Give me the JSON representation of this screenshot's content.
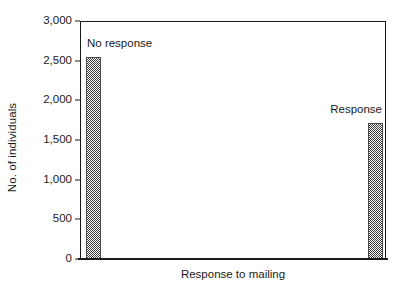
{
  "chart_data": {
    "type": "bar",
    "title": "",
    "xlabel": "Response to mailing",
    "ylabel": "No. of individuals",
    "categories": [
      "No response",
      "Response"
    ],
    "values": [
      2550,
      1720
    ],
    "series": [
      {
        "name": "No. of individuals",
        "values": [
          2550,
          1720
        ]
      }
    ],
    "ylim": [
      0,
      3000
    ],
    "yticks": [
      0,
      500,
      1000,
      1500,
      2000,
      2500,
      3000
    ],
    "ytick_labels": [
      "0",
      "500",
      "1,000",
      "1,500",
      "2,000",
      "2,500",
      "3,000"
    ],
    "grid": false,
    "legend": false,
    "annotations": [
      {
        "text": "No response",
        "category": "No response"
      },
      {
        "text": "Response",
        "category": "Response"
      }
    ],
    "bar_fill": "checkerboard-dither",
    "bar_color": "#3a3a3a",
    "axis_color": "#1a1a1a",
    "background": "#ffffff"
  }
}
